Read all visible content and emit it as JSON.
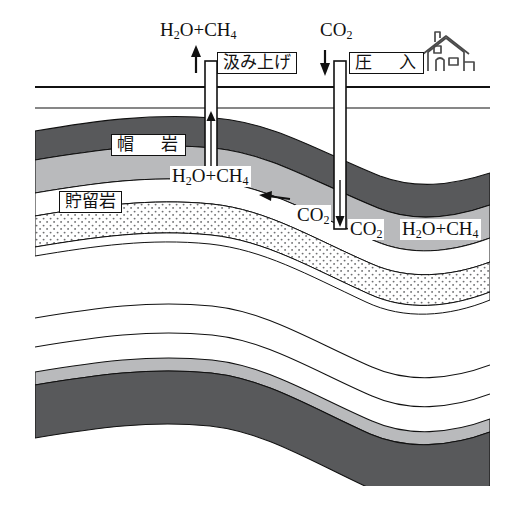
{
  "figure": {
    "kind": "geological-cross-section",
    "width": 507,
    "height": 511
  },
  "surface": {
    "house_icon": "house-icon",
    "ground_line_label": ""
  },
  "wells": [
    {
      "id": "production-well",
      "label": "汲み上げ",
      "top_formula_html": "H<sub>2</sub>O+CH<sub>4</sub>",
      "top_formula_text": "H2O+CH4",
      "arrow_direction": "up",
      "x": 211
    },
    {
      "id": "injection-well",
      "label": "圧　入",
      "top_formula_html": "CO<sub>2</sub>",
      "top_formula_text": "CO2",
      "arrow_direction": "down",
      "x": 340
    }
  ],
  "strata_labels": [
    {
      "id": "cap-rock",
      "text": "帽　岩",
      "reading": "boukan / cap rock"
    },
    {
      "id": "reservoir-rock",
      "text": "貯留岩",
      "reading": "choryuugan / reservoir rock"
    }
  ],
  "subsurface_formulas": [
    {
      "id": "reservoir-gas-left",
      "html": "H<sub>2</sub>O+CH<sub>4</sub>",
      "text": "H2O+CH4"
    },
    {
      "id": "co2-plume-left",
      "html": "CO<sub>2</sub>",
      "text": "CO2"
    },
    {
      "id": "co2-plume-right",
      "html": "CO<sub>2</sub>",
      "text": "CO2"
    },
    {
      "id": "reservoir-gas-right",
      "html": "H<sub>2</sub>O+CH<sub>4</sub>",
      "text": "H2O+CH4"
    }
  ],
  "flow_arrow": {
    "id": "migration-arrow",
    "direction": "left",
    "meaning": "gas migration toward production well"
  },
  "colors": {
    "outline": "#111111",
    "dark_stratum": "#58595b",
    "mid_stratum": "#b9babc",
    "light_stratum": "#d6d7d9",
    "stipple_dot": "#6e6f71",
    "background": "#ffffff",
    "well_casing": "#ffffff"
  },
  "layer_legend": [
    {
      "name": "overburden",
      "fill": "#ffffff"
    },
    {
      "name": "dark-shale-upper",
      "fill": "#58595b"
    },
    {
      "name": "cap-rock-gray",
      "fill": "#b9babc"
    },
    {
      "name": "reservoir-white",
      "fill": "#ffffff"
    },
    {
      "name": "stippled-sandstone",
      "fill": "stipple"
    },
    {
      "name": "deep-white-1",
      "fill": "#ffffff"
    },
    {
      "name": "deep-white-2",
      "fill": "#ffffff"
    },
    {
      "name": "thin-gray-band",
      "fill": "#b9babc"
    },
    {
      "name": "deep-dark-shale",
      "fill": "#58595b"
    }
  ]
}
